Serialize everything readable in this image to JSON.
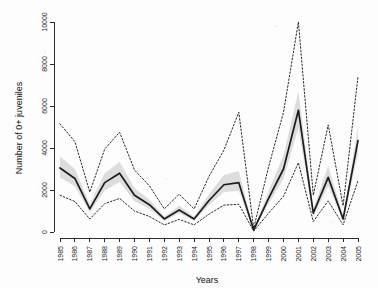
{
  "chart_data": {
    "type": "line",
    "title": "",
    "xlabel": "Years",
    "ylabel": "Number of 0+ juveniles",
    "grid": false,
    "legend": "none",
    "xlim": [
      1985,
      2005
    ],
    "ylim": [
      0,
      10000
    ],
    "ytick_labels": [
      "0",
      "2000",
      "4000",
      "6000",
      "8000",
      "10000"
    ],
    "ytick_values": [
      0,
      2000,
      4000,
      6000,
      8000,
      10000
    ],
    "x": [
      1985,
      1986,
      1987,
      1988,
      1989,
      1990,
      1991,
      1992,
      1993,
      1994,
      1995,
      1996,
      1997,
      1998,
      1999,
      2000,
      2001,
      2002,
      2003,
      2004,
      2005
    ],
    "xtick_labels": [
      "1985",
      "1986",
      "1987",
      "1988",
      "1989",
      "1990",
      "1991",
      "1992",
      "1993",
      "1994",
      "1995",
      "1996",
      "1997",
      "1998",
      "1999",
      "2000",
      "2001",
      "2002",
      "2003",
      "2004",
      "2005"
    ],
    "series": [
      {
        "name": "Fitted mean",
        "style": "solid",
        "color": "#1c1c1c",
        "values": [
          3050,
          2550,
          1100,
          2350,
          2800,
          1750,
          1300,
          620,
          1050,
          620,
          1500,
          2250,
          2350,
          100,
          1600,
          3000,
          5800,
          900,
          2600,
          620,
          4350
        ]
      },
      {
        "name": "Upper prediction interval",
        "style": "dotted",
        "color": "#2a2a2a",
        "values": [
          5150,
          4300,
          1900,
          3950,
          4750,
          2950,
          2200,
          1100,
          1800,
          1100,
          2650,
          3900,
          5700,
          180,
          3100,
          5700,
          10000,
          1750,
          5100,
          1250,
          7400
        ]
      },
      {
        "name": "Lower prediction interval",
        "style": "dotted",
        "color": "#2a2a2a",
        "values": [
          1750,
          1450,
          620,
          1350,
          1600,
          1000,
          740,
          340,
          600,
          340,
          850,
          1280,
          1320,
          40,
          900,
          1700,
          3300,
          500,
          1480,
          340,
          2450
        ]
      }
    ],
    "confidence_band": {
      "name": "Confidence band",
      "color": "#c9c9c9",
      "upper": [
        3600,
        3000,
        1320,
        2800,
        3350,
        2080,
        1550,
        740,
        1250,
        740,
        1800,
        2720,
        2900,
        130,
        1950,
        3650,
        6700,
        1080,
        3150,
        760,
        5000
      ],
      "lower": [
        2600,
        2180,
        930,
        1980,
        2380,
        1480,
        1100,
        520,
        890,
        520,
        1270,
        1900,
        1950,
        75,
        1340,
        2520,
        4950,
        760,
        2180,
        510,
        3750
      ]
    }
  }
}
